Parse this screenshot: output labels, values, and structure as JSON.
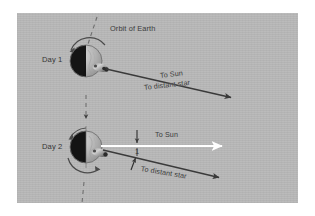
{
  "figure": {
    "title_label": "Orbit of Earth",
    "background_color": "#b9b9b9",
    "frame_color": "#ffffff",
    "ink_color": "#3a3a3a",
    "sun_ray_color": "#ffffff"
  },
  "labels": {
    "orbit_of_earth": "Orbit of Earth",
    "day1": "Day 1",
    "day2": "Day 2",
    "to_sun_day1": "To Sun",
    "to_distant_star_day1": "To distant star",
    "to_sun_day2": "To Sun",
    "to_distant_star_day2": "To distant star",
    "angle_value": "1"
  },
  "diagram": {
    "type": "astronomy-schematic",
    "panels": [
      {
        "name": "day1",
        "label": "Day 1",
        "earth": {
          "center_x": 86,
          "center_y": 61,
          "radius": 16,
          "night_side": "left",
          "day_side": "right",
          "night_color": "#111111",
          "day_color": "#bdbdbd"
        },
        "rotation_arrow": "counterclockwise-top",
        "observer_marker": "pin-lower-right",
        "rays": [
          {
            "name": "to-sun",
            "label": "To Sun",
            "color": "#3a3a3a",
            "x1": 104,
            "y1": 68,
            "x2": 232,
            "y2": 98
          },
          {
            "name": "to-distant-star",
            "label": "To distant star",
            "color": "#3a3a3a",
            "aligned_with": "to-sun"
          }
        ]
      },
      {
        "name": "day2",
        "label": "Day 2",
        "earth": {
          "center_x": 86,
          "center_y": 147,
          "radius": 16,
          "night_side": "left",
          "day_side": "right",
          "night_color": "#111111",
          "day_color": "#bdbdbd"
        },
        "rotation_arrow": "counterclockwise-bottom",
        "observer_marker": "pin-lower-right",
        "rays": [
          {
            "name": "to-sun",
            "label": "To Sun",
            "color": "#ffffff",
            "x1": 103,
            "y1": 146,
            "x2": 223,
            "y2": 146
          },
          {
            "name": "to-distant-star",
            "label": "To distant star",
            "color": "#3a3a3a",
            "x1": 103,
            "y1": 150,
            "x2": 220,
            "y2": 178
          }
        ],
        "angle_annotation": {
          "value": "1",
          "between": [
            "to-sun",
            "to-distant-star"
          ],
          "markers": [
            "down-arrow",
            "up-arrow"
          ]
        }
      }
    ],
    "orbit_path": {
      "style": "dashed",
      "orientation": "vertical",
      "direction_arrow": "downward",
      "segments": [
        "above-day1",
        "between-day1-and-day2",
        "below-day2"
      ]
    }
  }
}
